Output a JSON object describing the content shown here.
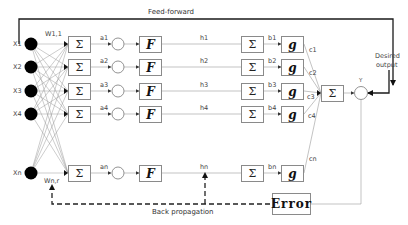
{
  "title_top": "Feed-forward",
  "title_bottom": "Back propagation",
  "desired_output": [
    "Desired",
    "output"
  ],
  "output_label": "Y",
  "weights": {
    "first": "W1,1",
    "last": "Wn,r"
  },
  "rows": [
    {
      "x": "X1",
      "a": "a1",
      "h": "h1",
      "b": "b1",
      "c": "c1"
    },
    {
      "x": "X2",
      "a": "a2",
      "h": "h2",
      "b": "b2",
      "c": "c2"
    },
    {
      "x": "X3",
      "a": "a3",
      "h": "h3",
      "b": "b3",
      "c": "c3"
    },
    {
      "x": "X4",
      "a": "a4",
      "h": "h4",
      "b": "b4",
      "c": "c4"
    },
    {
      "x": "Xn",
      "a": "an",
      "h": "hn",
      "b": "bn",
      "c": "cn"
    }
  ],
  "symbols": {
    "sum": "Σ",
    "f": "F",
    "g": "g",
    "error": "Error"
  },
  "colors": {
    "line_dark": "#1a1a1a",
    "line_light": "#9a9a9a",
    "box_border": "#8a8a8a",
    "node_fill": "#000000"
  }
}
